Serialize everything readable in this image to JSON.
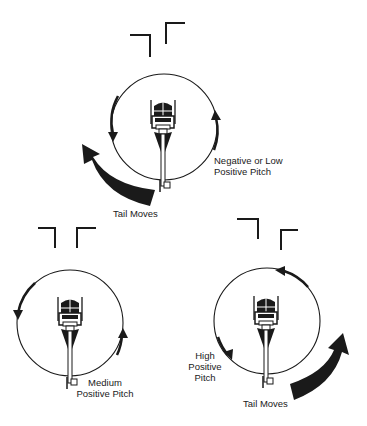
{
  "diagram": {
    "title": "",
    "colors": {
      "ink": "#1a1a1a",
      "background": "#ffffff"
    },
    "panels": [
      {
        "id": "top",
        "pitch_label": [
          "Negative or Low",
          "Positive Pitch"
        ],
        "tail_label": "Tail Moves",
        "rotation_arrows": "counter-clockwise (left side downward, right side upward)",
        "tail_movement": "large arrow on lower-left pointing up-left"
      },
      {
        "id": "bottom-left",
        "pitch_label": [
          "Medium",
          "Positive Pitch"
        ],
        "tail_label": "",
        "rotation_arrows": "left side downward, right side upward",
        "tail_movement": "none"
      },
      {
        "id": "bottom-right",
        "pitch_label": [
          "High",
          "Positive",
          "Pitch"
        ],
        "tail_label": "Tail Moves",
        "rotation_arrows": "top arrow pointing left, left-lower arrow pointing down",
        "tail_movement": "large arrow on lower-right pointing up-right"
      }
    ]
  }
}
